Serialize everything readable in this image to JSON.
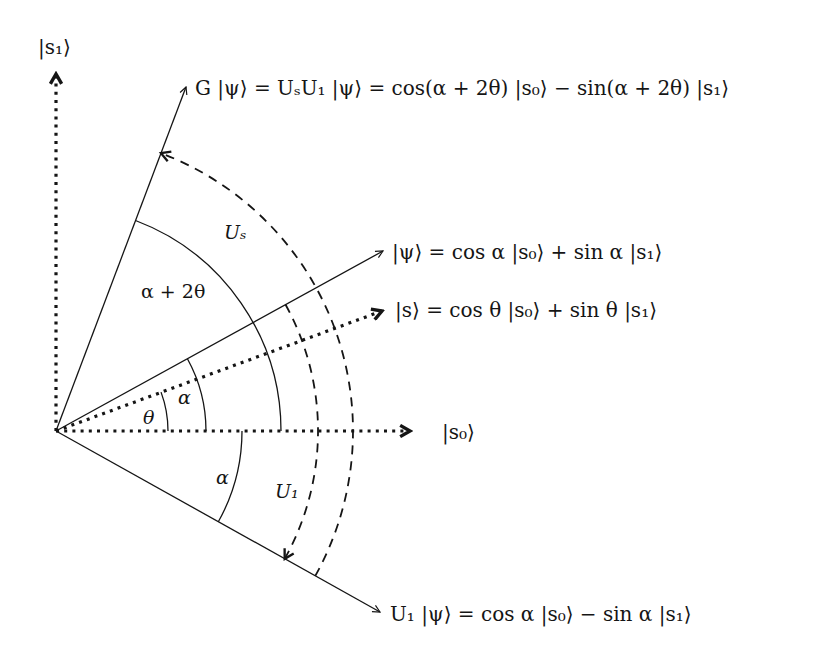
{
  "diagram": {
    "origin": [
      56,
      431
    ],
    "colors": {
      "ink": "#151515",
      "background": "#ffffff"
    },
    "axes": {
      "s0": {
        "label": "|s₀⟩",
        "angle_deg": 0,
        "length": 355,
        "style": "dotted"
      },
      "s1": {
        "label": "|s₁⟩",
        "angle_deg": 90,
        "length": 358,
        "style": "dotted"
      }
    },
    "vectors": [
      {
        "id": "G_psi",
        "label": "G |ψ⟩ = UₛU₁ |ψ⟩ = cos(α + 2θ) |s₀⟩ − sin(α + 2θ) |s₁⟩",
        "angle_deg": 69.3,
        "length": 368,
        "style": "solid"
      },
      {
        "id": "psi",
        "label": "|ψ⟩ = cos α |s₀⟩ + sin α |s₁⟩",
        "angle_deg": 28.8,
        "length": 373,
        "style": "solid"
      },
      {
        "id": "s",
        "label": "|s⟩ = cos θ |s₀⟩ + sin θ |s₁⟩",
        "angle_deg": 20.3,
        "length": 348,
        "style": "dotted"
      },
      {
        "id": "U1_psi",
        "label": "U₁ |ψ⟩ = cos α |s₀⟩ − sin α |s₁⟩",
        "angle_deg": -29.2,
        "length": 371,
        "style": "solid"
      }
    ],
    "angle_arcs": [
      {
        "label": "θ",
        "radius": 112,
        "from_deg": 0,
        "to_deg": 20.3
      },
      {
        "label": "α",
        "radius": 150,
        "from_deg": 0,
        "to_deg": 28.8
      },
      {
        "label": "α",
        "radius": 186,
        "from_deg": -29.2,
        "to_deg": 0
      },
      {
        "label": "α + 2θ",
        "radius": 225,
        "from_deg": 0,
        "to_deg": 69.3
      }
    ],
    "operator_arcs": [
      {
        "label": "U₁",
        "radius": 262,
        "from_deg": 28.8,
        "to_deg": -29.2,
        "style": "dashed",
        "arrow_at": "end"
      },
      {
        "label": "Uₛ",
        "radius": 297,
        "from_deg": -29.2,
        "to_deg": 69.3,
        "style": "dashed",
        "arrow_at": "end"
      }
    ],
    "labels": {
      "s1_axis": "|s₁⟩",
      "s0_axis": "|s₀⟩",
      "G_psi": "G |ψ⟩ = UₛU₁ |ψ⟩ = cos(α + 2θ) |s₀⟩ − sin(α + 2θ) |s₁⟩",
      "psi": "|ψ⟩ = cos α |s₀⟩ + sin α |s₁⟩",
      "s": "|s⟩ = cos θ |s₀⟩ + sin θ |s₁⟩",
      "U1_psi": "U₁ |ψ⟩ = cos α |s₀⟩ − sin α |s₁⟩",
      "theta": "θ",
      "alpha_upper": "α",
      "alpha_lower": "α",
      "alpha_plus_2theta": "α + 2θ",
      "Us": "Uₛ",
      "U1": "U₁"
    }
  }
}
